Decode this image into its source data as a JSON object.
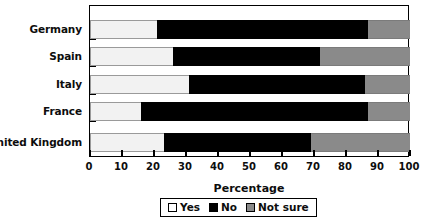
{
  "chart_data": {
    "type": "bar",
    "orientation": "horizontal",
    "stacked": true,
    "stack_mode": "percent",
    "title": "",
    "xlabel": "Percentage",
    "ylabel": "",
    "xlim": [
      0,
      100
    ],
    "xticks": [
      0,
      10,
      20,
      30,
      40,
      50,
      60,
      70,
      80,
      90,
      100
    ],
    "xticklabels": [
      "0",
      "10",
      "20",
      "30",
      "40",
      "50",
      "60",
      "70",
      "80",
      "90",
      "100"
    ],
    "grid": false,
    "legend_position": "bottom-center",
    "categories": [
      "Germany",
      "Spain",
      "Italy",
      "France",
      "United Kingdom"
    ],
    "series": [
      {
        "name": "Yes",
        "color": "#f2f2f2",
        "values": [
          21,
          26,
          31,
          16,
          23
        ]
      },
      {
        "name": "No",
        "color": "#000000",
        "values": [
          66,
          46,
          55,
          71,
          46
        ]
      },
      {
        "name": "Not sure",
        "color": "#8a8a8a",
        "values": [
          13,
          28,
          14,
          13,
          31
        ]
      }
    ],
    "segment_boundaries": {
      "Germany": {
        "yes_end": 21,
        "no_end": 87
      },
      "Spain": {
        "yes_end": 26,
        "no_end": 72
      },
      "Italy": {
        "yes_end": 31,
        "no_end": 86
      },
      "France": {
        "yes_end": 16,
        "no_end": 87
      },
      "United Kingdom": {
        "yes_end": 23,
        "no_end": 69
      }
    }
  },
  "legend": {
    "items": [
      {
        "label": "Yes",
        "swatch": "swatch-yes-icon"
      },
      {
        "label": "No",
        "swatch": "swatch-no-icon"
      },
      {
        "label": "Not sure",
        "swatch": "swatch-notsure-icon"
      }
    ]
  }
}
